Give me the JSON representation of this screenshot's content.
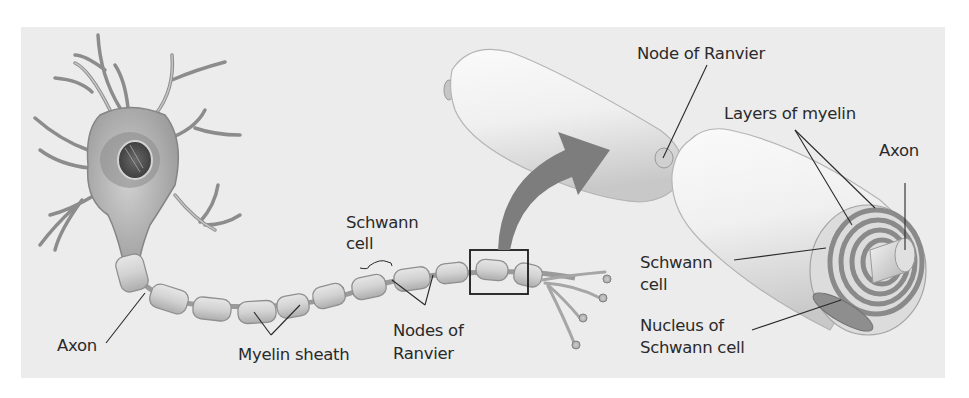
{
  "diagram": {
    "colors": {
      "background_panel": "#ececec",
      "neuron_fill": "#b9b9b9",
      "sheath_fill": "#d6d6d6",
      "arrow_fill": "#7d7d7d",
      "text": "#2a2a2a"
    },
    "labels": {
      "axon_left": "Axon",
      "myelin_sheath": "Myelin sheath",
      "schwann_cell_top_1": "Schwann",
      "schwann_cell_top_2": "cell",
      "nodes_of_ranvier_1": "Nodes of",
      "nodes_of_ranvier_2": "Ranvier",
      "node_of_ranvier": "Node of Ranvier",
      "layers_of_myelin": "Layers of myelin",
      "axon_right": "Axon",
      "schwann_cell_right_1": "Schwann",
      "schwann_cell_right_2": "cell",
      "nucleus_1": "Nucleus of",
      "nucleus_2": "Schwann cell"
    },
    "parts": [
      "cell-body",
      "dendrites",
      "nucleus",
      "axon",
      "myelin-sheath-segments",
      "nodes-of-ranvier",
      "axon-terminals",
      "zoom-box",
      "magnify-arrow",
      "enlarged-schwann-cells",
      "myelin-cross-section"
    ]
  }
}
